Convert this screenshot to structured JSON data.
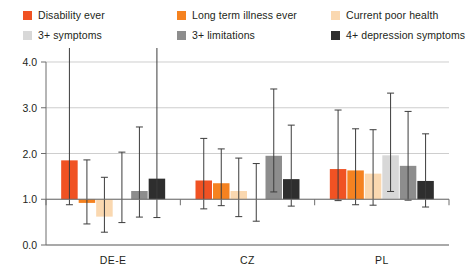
{
  "legend": {
    "items": [
      {
        "label": "Disability ever",
        "color": "#f05223",
        "swatch": "legend-swatch-disability-ever"
      },
      {
        "label": "Long term illness ever",
        "color": "#f58220",
        "swatch": "legend-swatch-long-term-illness-ever"
      },
      {
        "label": "Current poor health",
        "color": "#fad8b0",
        "swatch": "legend-swatch-current-poor-health"
      },
      {
        "label": "3+ symptoms",
        "color": "#d8d8d8",
        "swatch": "legend-swatch-3-plus-symptoms"
      },
      {
        "label": "3+ limitations",
        "color": "#8d8d8d",
        "swatch": "legend-swatch-3-plus-limitations"
      },
      {
        "label": "4+ depression symptoms",
        "color": "#2e2e2e",
        "swatch": "legend-swatch-4-plus-depression-symptoms"
      }
    ]
  },
  "chart_data": {
    "type": "bar",
    "title": "",
    "subtitle": "",
    "xlabel": "",
    "ylabel": "",
    "categories": [
      "DE-E",
      "CZ",
      "PL"
    ],
    "ylim": [
      0.0,
      4.0
    ],
    "yticks": [
      0.0,
      1.0,
      2.0,
      3.0,
      4.0
    ],
    "ytick_labels": [
      "0.0",
      "1.0",
      "2.0",
      "3.0",
      "4.0"
    ],
    "grid": true,
    "legend_position": "top",
    "baseline": 1.0,
    "error_bar_type": "95% CI",
    "series": [
      {
        "name": "Disability ever",
        "color": "#f05223",
        "values": [
          1.85,
          1.41,
          1.66
        ],
        "ci_low": [
          0.88,
          0.79,
          0.97
        ],
        "ci_high": [
          4.35,
          2.33,
          2.95
        ]
      },
      {
        "name": "Long term illness ever",
        "color": "#f58220",
        "values": [
          0.92,
          1.35,
          1.63
        ],
        "ci_low": [
          0.46,
          0.86,
          0.88
        ],
        "ci_high": [
          1.86,
          2.1,
          2.54
        ]
      },
      {
        "name": "Current poor health",
        "color": "#fad8b0",
        "values": [
          0.62,
          1.18,
          1.56
        ],
        "ci_low": [
          0.28,
          0.62,
          0.87
        ],
        "ci_high": [
          1.48,
          1.9,
          2.52
        ]
      },
      {
        "name": "3+ symptoms",
        "color": "#d8d8d8",
        "values": [
          1.0,
          1.0,
          1.96
        ],
        "ci_low": [
          0.49,
          0.52,
          1.17
        ],
        "ci_high": [
          2.03,
          1.78,
          3.32
        ]
      },
      {
        "name": "3+ limitations",
        "color": "#8d8d8d",
        "values": [
          1.18,
          1.95,
          1.73
        ],
        "ci_low": [
          0.61,
          1.16,
          0.98
        ],
        "ci_high": [
          2.58,
          3.41,
          2.92
        ]
      },
      {
        "name": "4+ depression symptoms",
        "color": "#2e2e2e",
        "values": [
          1.45,
          1.44,
          1.4
        ],
        "ci_low": [
          0.6,
          0.85,
          0.83
        ],
        "ci_high": [
          4.35,
          2.62,
          2.43
        ]
      }
    ]
  }
}
